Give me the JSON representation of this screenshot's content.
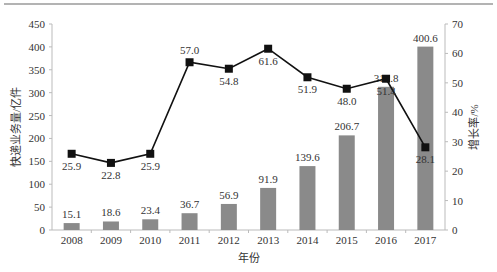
{
  "chart_data": {
    "type": "bar+line",
    "title": "",
    "categories": [
      "2008",
      "2009",
      "2010",
      "2011",
      "2012",
      "2013",
      "2014",
      "2015",
      "2016",
      "2017"
    ],
    "series": [
      {
        "name": "快递业务量",
        "type": "bar",
        "axis": "left",
        "color": "#8a8a8a",
        "values": [
          15.1,
          18.6,
          23.4,
          36.7,
          56.9,
          91.9,
          139.6,
          206.7,
          312.8,
          400.6
        ]
      },
      {
        "name": "增长率",
        "type": "line",
        "axis": "right",
        "color": "#111111",
        "marker": "square",
        "values": [
          25.9,
          22.8,
          25.9,
          57.0,
          54.8,
          61.6,
          51.9,
          48.0,
          51.4,
          28.1
        ]
      }
    ],
    "xlabel": "年份",
    "ylabel": "快递业务量/亿件",
    "y2label": "增长率/%",
    "ylim": [
      0,
      450
    ],
    "y2lim": [
      0,
      70
    ],
    "yticks": [
      0,
      50,
      100,
      150,
      200,
      250,
      300,
      350,
      400,
      450
    ],
    "y2ticks": [
      0,
      10,
      20,
      30,
      40,
      50,
      60,
      70
    ],
    "grid": false,
    "legend": null
  },
  "colors": {
    "bar": "#8a8a8a",
    "line": "#111111",
    "axis": "#bbbbbb",
    "text": "#333333",
    "top_rule": "#999999"
  }
}
